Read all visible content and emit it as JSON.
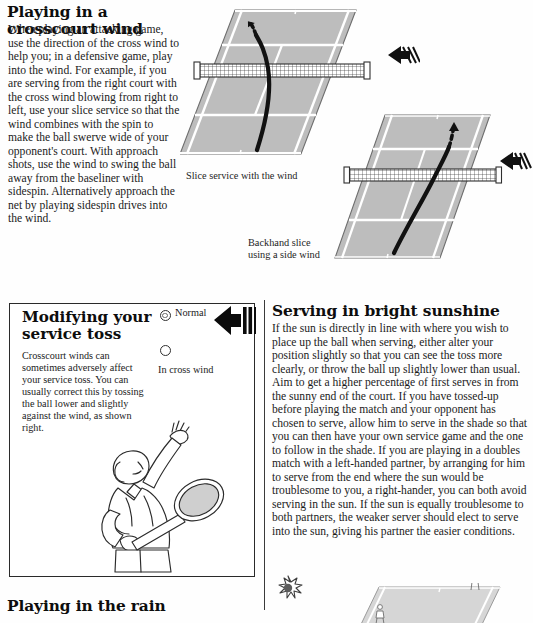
{
  "page": {
    "width": 533,
    "height": 620,
    "background": "#fefefe",
    "court_fill": "#bdbdbd",
    "court_line": "#ffffff",
    "ink": "#131313"
  },
  "article_crosscourt": {
    "heading": "Playing in a crosscourt wind",
    "body": "When playing an attacking game, use the direction of the cross wind to help you; in a defensive game, play into the wind. For example, if you are serving from the right court with the cross wind blowing from right to left, use your slice service so that the wind combines with the spin to make the ball swerve wide of your opponent's court. With approach shots, use the wind to swing the ball away from the baseliner with sidespin. Alternatively approach the net by playing sidespin drives into the wind."
  },
  "diagrams": {
    "court_one": {
      "caption": "Slice service with the wind",
      "icon": "tennis-court-perspective",
      "wind": "wind-arrow-left",
      "trajectory": "slice-service-curve"
    },
    "court_two": {
      "caption_line1": "Backhand slice",
      "caption_line2": "using a side wind",
      "icon": "tennis-court-perspective",
      "wind": "wind-arrow-left",
      "trajectory": "backhand-slice-curve"
    }
  },
  "panel_service_toss": {
    "heading_line1": "Modifying your",
    "heading_line2": "service toss",
    "body": "Crosscourt winds can sometimes adversely affect your service toss. You can usually correct this by tossing the ball lower and slightly against the wind, as shown right.",
    "label_normal": "Normal",
    "label_cross_wind": "In cross wind",
    "wind_icon": "wind-arrow-left-large",
    "illustration": "tennis-player-serving"
  },
  "article_sunshine": {
    "heading": "Serving in bright sunshine",
    "body": "If the sun is directly in line with where you wish to place up the ball when serving, either alter your position slightly so that you can see the toss more clearly, or throw the ball up slightly lower than usual. Aim to get a higher percentage of first serves in from the sunny end of the court. If you have tossed-up before playing the match and your opponent has chosen to serve, allow him to serve in the shade so that you can then have your own service game and the one to follow in the shade. If you are playing in a doubles match with a left-handed partner, by arranging for him to serve from the end where the sun would be troublesome to you, a right-hander, you can both avoid serving in the sun. If the sun is equally troublesome to both partners, the weaker server should elect to serve into the sun, giving his partner the easier conditions.",
    "sun_icon": "sun-burst-icon",
    "court_icon": "tennis-court-sunshine"
  },
  "article_rain": {
    "heading": "Playing in the rain"
  }
}
